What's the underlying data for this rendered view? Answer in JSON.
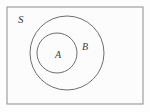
{
  "figure": {
    "type": "venn-diagram",
    "background_color": "#fdfdfd",
    "border_color": "#8c8c8c",
    "circle_color": "#6e6e6e",
    "label_color": "#3b3b3b"
  },
  "universe": {
    "label": "S",
    "label_x": 18,
    "label_y": 23,
    "rect": {
      "x": 7,
      "y": 7,
      "width": 136,
      "height": 97
    }
  },
  "sets": [
    {
      "id": "B",
      "label": "B",
      "label_x": 82,
      "label_y": 50,
      "cx": 67,
      "cy": 53,
      "r": 37
    },
    {
      "id": "A",
      "label": "A",
      "label_x": 55,
      "label_y": 58,
      "cx": 57,
      "cy": 53,
      "r": 20
    }
  ],
  "relations": {
    "description": "A is a proper subset of B; B is a subset of S"
  }
}
